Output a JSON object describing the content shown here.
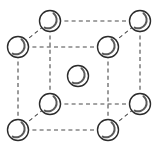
{
  "figure": {
    "type": "crystal-lattice-diagram",
    "width": 155,
    "height": 156,
    "background_color": "#ffffff",
    "line_color": "#4a4a4a",
    "atom_outline_color": "#2b2b2b",
    "atom_fill_color": "#ffffff",
    "atom_shade_color": "#5a5a5a",
    "edge_style": "dashed",
    "atom_radius": 10.5,
    "atom_count": 9,
    "corner_atom_count": 8,
    "center_atom_count": 1
  },
  "cell": {
    "front_face": {
      "left": 18,
      "right": 108,
      "top": 47,
      "bottom": 130
    },
    "depth_offset": {
      "dx": 42,
      "dy": -26
    }
  },
  "atoms": [
    {
      "name": "back-top-left",
      "cx": 50,
      "cy": 21,
      "r": 10.5,
      "label": "corner"
    },
    {
      "name": "back-top-right",
      "cx": 140,
      "cy": 21,
      "r": 10.5,
      "label": "corner"
    },
    {
      "name": "front-top-left",
      "cx": 18,
      "cy": 47,
      "r": 10.5,
      "label": "corner"
    },
    {
      "name": "front-top-right",
      "cx": 108,
      "cy": 47,
      "r": 10.5,
      "label": "corner"
    },
    {
      "name": "body-center",
      "cx": 78,
      "cy": 76,
      "r": 10.5,
      "label": "center"
    },
    {
      "name": "back-bottom-left",
      "cx": 50,
      "cy": 104,
      "r": 10.5,
      "label": "corner"
    },
    {
      "name": "back-bottom-right",
      "cx": 140,
      "cy": 104,
      "r": 10.5,
      "label": "corner"
    },
    {
      "name": "front-bottom-left",
      "cx": 18,
      "cy": 130,
      "r": 10.5,
      "label": "corner"
    },
    {
      "name": "front-bottom-right",
      "cx": 108,
      "cy": 130,
      "r": 10.5,
      "label": "corner"
    }
  ],
  "edges": [
    {
      "name": "edge-back-top",
      "x1": 50,
      "y1": 21,
      "x2": 140,
      "y2": 21
    },
    {
      "name": "edge-front-top",
      "x1": 18,
      "y1": 47,
      "x2": 108,
      "y2": 47
    },
    {
      "name": "edge-back-bottom",
      "x1": 50,
      "y1": 104,
      "x2": 140,
      "y2": 104
    },
    {
      "name": "edge-front-bottom",
      "x1": 18,
      "y1": 130,
      "x2": 108,
      "y2": 130
    },
    {
      "name": "edge-left-front-vertical",
      "x1": 18,
      "y1": 47,
      "x2": 18,
      "y2": 130
    },
    {
      "name": "edge-right-front-vertical",
      "x1": 108,
      "y1": 47,
      "x2": 108,
      "y2": 130
    },
    {
      "name": "edge-left-back-vertical",
      "x1": 50,
      "y1": 21,
      "x2": 50,
      "y2": 104
    },
    {
      "name": "edge-right-back-vertical",
      "x1": 140,
      "y1": 21,
      "x2": 140,
      "y2": 104
    },
    {
      "name": "edge-top-left-diagonal",
      "x1": 18,
      "y1": 47,
      "x2": 50,
      "y2": 21
    },
    {
      "name": "edge-top-right-diagonal",
      "x1": 108,
      "y1": 47,
      "x2": 140,
      "y2": 21
    },
    {
      "name": "edge-bottom-left-diagonal",
      "x1": 18,
      "y1": 130,
      "x2": 50,
      "y2": 104
    },
    {
      "name": "edge-bottom-right-diagonal",
      "x1": 108,
      "y1": 130,
      "x2": 140,
      "y2": 104
    }
  ]
}
